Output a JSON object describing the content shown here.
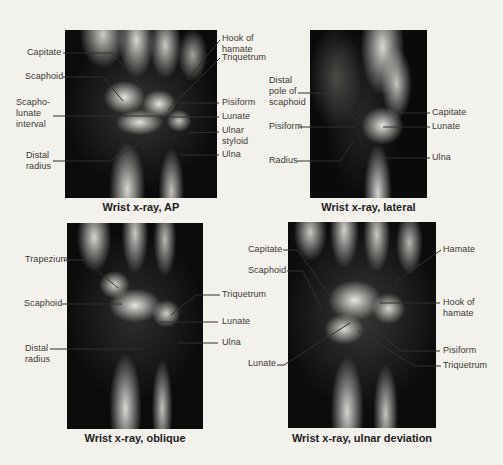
{
  "figure": {
    "type": "labeled-radiograph-figure",
    "colors": {
      "page_background": "#f3f1ec",
      "label_text": "#3b3833",
      "caption_text": "#22201c",
      "leader_line": "#34312c",
      "xray_background": "#0b0b0b"
    },
    "panels": [
      {
        "view": "AP",
        "caption": "Wrist x-ray, AP",
        "labels": {
          "capitate": "Capitate",
          "scaphoid": "Scaphoid",
          "scapholunate_interval": "Scapho-\nlunate\ninterval",
          "distal_radius": "Distal\nradius",
          "hook_of_hamate": "Hook of\nhamate",
          "triquetrum": "Triquetrum",
          "pisiform": "Pisiform",
          "lunate": "Lunate",
          "ulnar_styloid": "Ulnar\nstyloid",
          "ulna": "Ulna"
        }
      },
      {
        "view": "lateral",
        "caption": "Wrist x-ray, lateral",
        "labels": {
          "distal_pole_of_scaphoid": "Distal\npole of\nscaphoid",
          "pisiform": "Pisiform",
          "radius": "Radius",
          "capitate": "Capitate",
          "lunate": "Lunate",
          "ulna": "Ulna"
        }
      },
      {
        "view": "oblique",
        "caption": "Wrist x-ray, oblique",
        "labels": {
          "trapezium": "Trapezium",
          "scaphoid": "Scaphoid",
          "distal_radius": "Distal\nradius",
          "triquetrum": "Triquetrum",
          "lunate": "Lunate",
          "ulna": "Ulna"
        }
      },
      {
        "view": "ulnar deviation",
        "caption": "Wrist x-ray, ulnar deviation",
        "labels": {
          "capitate": "Capitate",
          "scaphoid": "Scaphoid",
          "lunate": "Lunate",
          "hamate": "Hamate",
          "hook_of_hamate": "Hook of\nhamate",
          "pisiform": "Pisiform",
          "triquetrum": "Triquetrum"
        }
      }
    ]
  }
}
